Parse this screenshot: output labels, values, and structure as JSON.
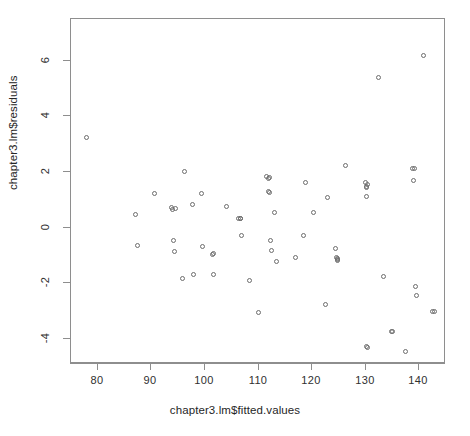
{
  "chart_data": {
    "type": "scatter",
    "title": "",
    "xlabel": "chapter3.lm$fitted.values",
    "ylabel": "chapter3.lm$residuals",
    "xlim": [
      75.0,
      145.0
    ],
    "ylim": [
      -4.9,
      7.5
    ],
    "xticks": [
      80,
      90,
      100,
      110,
      120,
      130,
      140
    ],
    "xtick_labels": [
      "80",
      "90",
      "100",
      "110",
      "120",
      "130",
      "140"
    ],
    "yticks": [
      -4,
      -2,
      0,
      2,
      4,
      6
    ],
    "ytick_labels": [
      "-4",
      "-2",
      "0",
      "2",
      "4",
      "6"
    ],
    "grid": false,
    "legend": null,
    "marker": "open-circle",
    "marker_color": "#6d6d6d",
    "frame_color": "#8e8e8e",
    "background": "#ffffff",
    "n_points": 66,
    "x": [
      78.0,
      87.3,
      87.6,
      90.8,
      93.9,
      94.2,
      94.4,
      94.5,
      95.9,
      96.4,
      97.9,
      98.0,
      99.6,
      99.8,
      101.6,
      101.8,
      104.2,
      106.5,
      106.9,
      107.0,
      108.5,
      110.1,
      111.6,
      112.0,
      112.1,
      112.4,
      112.6,
      113.2,
      113.6,
      117.1,
      118.6,
      119.0,
      120.4,
      122.6,
      123.0,
      124.6,
      124.8,
      124.9,
      125.0,
      126.4,
      130.2,
      130.3,
      130.4,
      130.5,
      130.6,
      132.6,
      133.6,
      135.0,
      137.6,
      138.9,
      139.2,
      139.4,
      139.6,
      140.9,
      142.7,
      143.0,
      94.6,
      112.2,
      124.9,
      130.4,
      106.8,
      101.7,
      112.3,
      130.3,
      139.3,
      135.1
    ],
    "y": [
      3.2,
      0.45,
      -0.68,
      1.2,
      0.68,
      0.62,
      -0.5,
      -0.9,
      -1.85,
      2.0,
      0.8,
      -1.7,
      1.2,
      -0.72,
      -1.0,
      -1.7,
      0.72,
      0.28,
      0.3,
      -0.3,
      -1.95,
      -3.1,
      1.8,
      1.75,
      1.25,
      -0.5,
      -0.85,
      0.5,
      -1.25,
      -1.1,
      -0.3,
      1.6,
      0.5,
      -2.8,
      1.05,
      -0.8,
      -1.1,
      -1.2,
      -1.15,
      2.2,
      1.6,
      1.45,
      1.1,
      -4.35,
      1.5,
      5.35,
      -1.8,
      -3.75,
      -4.5,
      2.1,
      1.65,
      -2.15,
      -2.48,
      6.15,
      -3.05,
      -3.05,
      0.65,
      1.78,
      -1.18,
      1.42,
      0.3,
      -0.98,
      1.22,
      -4.3,
      2.08,
      -3.78
    ]
  },
  "plot_geometry": {
    "frame_left": 70,
    "frame_top": 18,
    "frame_width": 375,
    "frame_height": 345
  }
}
